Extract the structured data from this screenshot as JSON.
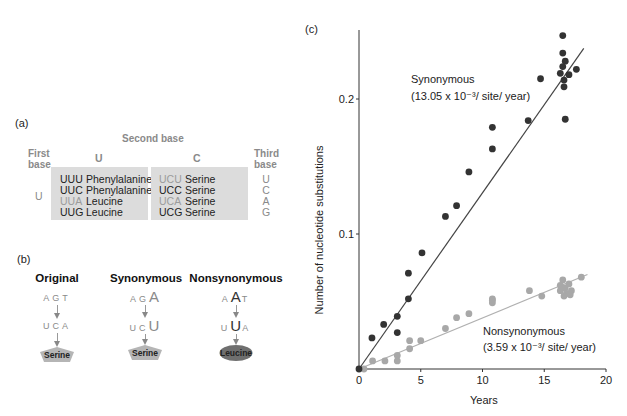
{
  "panel_a": {
    "label": "(a)",
    "second_base_header": "Second base",
    "first_base_header": "First base",
    "first_base_header_lines": [
      "First",
      "base"
    ],
    "third_base_header_lines": [
      "Third",
      "base"
    ],
    "first_base_value": "U",
    "columns": [
      {
        "second_base": "U",
        "rows": [
          {
            "codon": "UUU",
            "amino_acid": "Phenylalanine",
            "highlighted": false
          },
          {
            "codon": "UUC",
            "amino_acid": "Phenylalanine",
            "highlighted": false
          },
          {
            "codon": "UUA",
            "amino_acid": "Leucine",
            "highlighted": true
          },
          {
            "codon": "UUG",
            "amino_acid": "Leucine",
            "highlighted": false
          }
        ]
      },
      {
        "second_base": "C",
        "rows": [
          {
            "codon": "UCU",
            "amino_acid": "Serine",
            "highlighted": true
          },
          {
            "codon": "UCC",
            "amino_acid": "Serine",
            "highlighted": false
          },
          {
            "codon": "UCA",
            "amino_acid": "Serine",
            "highlighted": true
          },
          {
            "codon": "UCG",
            "amino_acid": "Serine",
            "highlighted": false
          }
        ]
      }
    ],
    "third_base": [
      "U",
      "C",
      "A",
      "G"
    ]
  },
  "panel_b": {
    "label": "(b)",
    "cases": [
      {
        "title": "Original",
        "dna": [
          "A",
          "G",
          "T"
        ],
        "rna": [
          "U",
          "C",
          "A"
        ],
        "mutated_index": -1,
        "protein": "Serine",
        "protein_shape": "pentagon",
        "protein_color": "#b5b5b5"
      },
      {
        "title": "Synonymous",
        "dna": [
          "A",
          "G",
          "A"
        ],
        "rna": [
          "U",
          "C",
          "U"
        ],
        "mutated_index": 2,
        "protein": "Serine",
        "protein_shape": "pentagon",
        "protein_color": "#b5b5b5"
      },
      {
        "title": "Nonsynonymous",
        "dna": [
          "A",
          "A",
          "T"
        ],
        "rna": [
          "U",
          "U",
          "A"
        ],
        "mutated_index": 1,
        "protein": "Leucine",
        "protein_shape": "ellipse",
        "protein_color": "#6f6f6f"
      }
    ]
  },
  "panel_c": {
    "label": "(c)"
  },
  "chart_data": {
    "type": "scatter",
    "title": "",
    "xlabel": "Years",
    "ylabel": "Number of nucleotide substitutions",
    "xlim": [
      0,
      20
    ],
    "ylim": [
      0,
      0.25
    ],
    "xticks": [
      0,
      5,
      10,
      15,
      20
    ],
    "yticks": [
      0.1,
      0.2
    ],
    "ytick_labels": [
      "0.1",
      "0.2"
    ],
    "grid": false,
    "legend": "inline annotations",
    "series": [
      {
        "name": "Synonymous",
        "annotation": "Synonymous",
        "rate_label": "(13.05 x 10⁻³/ site/ year)",
        "rate": 0.01305,
        "color": "#333333",
        "fit_line": {
          "x": [
            0,
            18.2
          ],
          "y": [
            0,
            0.2375
          ]
        },
        "points": [
          {
            "x": 0,
            "y": 0
          },
          {
            "x": 1.05,
            "y": 0.023
          },
          {
            "x": 2.0,
            "y": 0.033
          },
          {
            "x": 3.1,
            "y": 0.039
          },
          {
            "x": 3.1,
            "y": 0.027
          },
          {
            "x": 4.0,
            "y": 0.052
          },
          {
            "x": 4.0,
            "y": 0.071
          },
          {
            "x": 5.1,
            "y": 0.086
          },
          {
            "x": 7.0,
            "y": 0.113
          },
          {
            "x": 7.9,
            "y": 0.121
          },
          {
            "x": 8.9,
            "y": 0.146
          },
          {
            "x": 10.8,
            "y": 0.163
          },
          {
            "x": 10.8,
            "y": 0.179
          },
          {
            "x": 13.7,
            "y": 0.184
          },
          {
            "x": 14.7,
            "y": 0.215
          },
          {
            "x": 16.5,
            "y": 0.247
          },
          {
            "x": 16.5,
            "y": 0.234
          },
          {
            "x": 16.7,
            "y": 0.228
          },
          {
            "x": 16.5,
            "y": 0.224
          },
          {
            "x": 16.3,
            "y": 0.219
          },
          {
            "x": 17.0,
            "y": 0.218
          },
          {
            "x": 17.6,
            "y": 0.222
          },
          {
            "x": 16.6,
            "y": 0.214
          },
          {
            "x": 16.6,
            "y": 0.209
          },
          {
            "x": 16.7,
            "y": 0.185
          }
        ]
      },
      {
        "name": "Nonsynonymous",
        "annotation": "Nonsynonymous",
        "rate_label": "(3.59 x 10⁻³/ site/ year)",
        "rate": 0.00359,
        "color": "#a8a8a8",
        "fit_line": {
          "x": [
            0,
            18.5
          ],
          "y": [
            0,
            0.07
          ]
        },
        "points": [
          {
            "x": 0.4,
            "y": 0.0
          },
          {
            "x": 1.1,
            "y": 0.006
          },
          {
            "x": 2.1,
            "y": 0.006
          },
          {
            "x": 3.1,
            "y": 0.006
          },
          {
            "x": 3.1,
            "y": 0.01
          },
          {
            "x": 4.1,
            "y": 0.015
          },
          {
            "x": 4.1,
            "y": 0.021
          },
          {
            "x": 5.0,
            "y": 0.021
          },
          {
            "x": 7.0,
            "y": 0.03
          },
          {
            "x": 7.9,
            "y": 0.038
          },
          {
            "x": 8.9,
            "y": 0.041
          },
          {
            "x": 10.8,
            "y": 0.049
          },
          {
            "x": 10.8,
            "y": 0.051
          },
          {
            "x": 10.8,
            "y": 0.052
          },
          {
            "x": 13.8,
            "y": 0.058
          },
          {
            "x": 14.8,
            "y": 0.054
          },
          {
            "x": 16.3,
            "y": 0.058
          },
          {
            "x": 16.3,
            "y": 0.062
          },
          {
            "x": 16.5,
            "y": 0.066
          },
          {
            "x": 16.7,
            "y": 0.06
          },
          {
            "x": 16.8,
            "y": 0.056
          },
          {
            "x": 17.0,
            "y": 0.063
          },
          {
            "x": 17.2,
            "y": 0.058
          },
          {
            "x": 16.6,
            "y": 0.054
          },
          {
            "x": 17.1,
            "y": 0.055
          },
          {
            "x": 18.0,
            "y": 0.068
          }
        ]
      }
    ]
  }
}
